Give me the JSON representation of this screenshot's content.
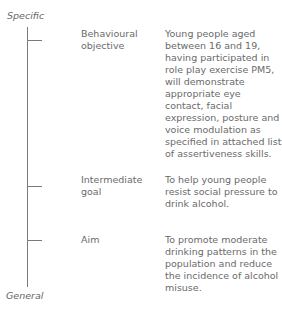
{
  "axis": {
    "top_label": "Specific",
    "bottom_label": "General"
  },
  "levels": [
    {
      "label": "Behavioural objective",
      "description": "Young people aged between 16 and 19, having participated in role play exercise PM5, will demonstrate appropriate eye contact, facial expression, posture and voice modulation as specified in attached list of assertiveness skills."
    },
    {
      "label": "Intermediate goal",
      "description": "To help young people resist social pressure to drink alcohol."
    },
    {
      "label": "Aim",
      "description": "To promote moderate drinking patterns in the population and reduce the incidence of alcohol misuse."
    }
  ]
}
